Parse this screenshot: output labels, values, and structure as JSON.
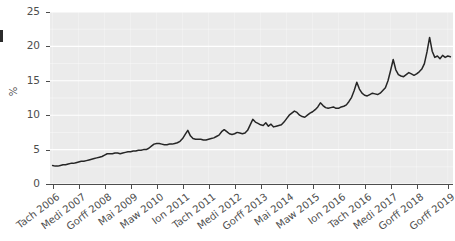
{
  "chart_data": {
    "type": "line",
    "title": "",
    "subtitle": "",
    "xlabel": "",
    "ylabel": "%",
    "ylim": [
      0,
      25
    ],
    "yticks": [
      0,
      5,
      10,
      15,
      20,
      25
    ],
    "ytick_labels": [
      "0",
      "5",
      "10",
      "15",
      "20",
      "25"
    ],
    "grid": true,
    "grid_color": "#ffffff",
    "panel_background": "#ebebeb",
    "line_color": "#262626",
    "legend": "none",
    "xtick_labels": [
      "Tach 2006",
      "Medi 2007",
      "Gorff 2008",
      "Mai 2009",
      "Mawrth 2010",
      "Ion 2011",
      "Tach 2011",
      "Medi 2012",
      "Gorff 2013",
      "Mai 2014",
      "Mawrth 2015",
      "Ion 2016",
      "Tach 2016",
      "Medi 2017",
      "Gorff 2018",
      "Gorff 2019"
    ],
    "xtick_labels_rendered": [
      "Tach 2006",
      "Medi 2007",
      "Gorff 2008",
      "Mai 2009",
      "Maw 2010",
      "Ion 2011",
      "Tach 2011",
      "Medi 2012",
      "Gorff 2013",
      "Mai 2014",
      "Maw 2015",
      "Ion 2016",
      "Tach 2016",
      "Medi 2017",
      "Gorff 2018",
      "Gorff 2019"
    ],
    "x": [
      0,
      1,
      2,
      3,
      4,
      5,
      6,
      7,
      8,
      9,
      10,
      11,
      12,
      13,
      14,
      15,
      16,
      17,
      18,
      19,
      20,
      21,
      22,
      23,
      24,
      25,
      26,
      27,
      28,
      29,
      30,
      31,
      32,
      33,
      34,
      35,
      36,
      37,
      38,
      39,
      40,
      41,
      42,
      43,
      44,
      45,
      46,
      47,
      48,
      49,
      50,
      51,
      52,
      53,
      54,
      55,
      56,
      57,
      58,
      59,
      60,
      61,
      62,
      63,
      64,
      65,
      66,
      67,
      68,
      69,
      70,
      71,
      72,
      73,
      74,
      75,
      76,
      77,
      78,
      79,
      80,
      81,
      82,
      83,
      84,
      85,
      86,
      87,
      88,
      89,
      90,
      91,
      92,
      93,
      94,
      95,
      96,
      97,
      98,
      99,
      100,
      101,
      102,
      103,
      104,
      105,
      106,
      107,
      108,
      109,
      110,
      111,
      112,
      113,
      114,
      115,
      116,
      117,
      118,
      119,
      120,
      121,
      122,
      123,
      124,
      125,
      126,
      127,
      128,
      129,
      130,
      131,
      132,
      133,
      134,
      135,
      136,
      137,
      138,
      139,
      140,
      141,
      142,
      143,
      144,
      145,
      146,
      147,
      148,
      149,
      150,
      151,
      152,
      153
    ],
    "values": [
      2.7,
      2.6,
      2.6,
      2.7,
      2.8,
      2.8,
      2.9,
      3.0,
      3.0,
      3.1,
      3.2,
      3.3,
      3.3,
      3.4,
      3.5,
      3.6,
      3.7,
      3.8,
      3.9,
      4.0,
      4.2,
      4.4,
      4.4,
      4.4,
      4.5,
      4.5,
      4.4,
      4.5,
      4.6,
      4.7,
      4.7,
      4.8,
      4.8,
      4.9,
      4.9,
      5.0,
      5.0,
      5.2,
      5.5,
      5.8,
      5.9,
      5.9,
      5.8,
      5.7,
      5.7,
      5.8,
      5.8,
      5.9,
      6.0,
      6.2,
      6.6,
      7.2,
      7.8,
      7.0,
      6.6,
      6.5,
      6.5,
      6.5,
      6.4,
      6.4,
      6.5,
      6.6,
      6.7,
      6.9,
      7.1,
      7.6,
      7.9,
      7.6,
      7.3,
      7.2,
      7.3,
      7.5,
      7.4,
      7.3,
      7.4,
      7.8,
      8.6,
      9.4,
      9.0,
      8.8,
      8.6,
      8.5,
      8.9,
      8.4,
      8.7,
      8.3,
      8.4,
      8.5,
      8.6,
      9.0,
      9.5,
      10.0,
      10.3,
      10.6,
      10.4,
      10.0,
      9.8,
      9.7,
      10.0,
      10.3,
      10.5,
      10.8,
      11.2,
      11.8,
      11.4,
      11.1,
      11.0,
      11.1,
      11.2,
      11.0,
      11.0,
      11.2,
      11.3,
      11.5,
      12.0,
      12.6,
      13.6,
      14.8,
      13.8,
      13.2,
      12.9,
      12.8,
      13.0,
      13.2,
      13.1,
      13.0,
      13.2,
      13.6,
      14.0,
      15.0,
      16.5,
      18.1,
      16.6,
      15.9,
      15.7,
      15.6,
      15.9,
      16.2,
      16.0,
      15.8,
      16.0,
      16.3,
      16.7,
      17.5,
      19.2,
      21.3,
      19.3,
      18.4,
      18.6,
      18.2,
      18.7,
      18.4,
      18.6,
      18.5
    ],
    "xtick_positions": [
      0,
      10,
      20,
      30,
      40,
      50,
      60,
      70,
      80,
      90,
      100,
      110,
      120,
      130,
      140,
      152
    ],
    "x_range": [
      -1,
      154
    ],
    "series_name": ""
  }
}
